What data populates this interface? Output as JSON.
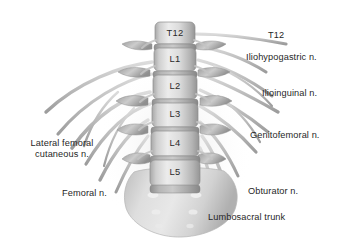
{
  "figure": {
    "background_color": "#ffffff",
    "width": 347,
    "height": 242,
    "style": "grayscale medical illustration"
  },
  "palette": {
    "background": "#ffffff",
    "bone_light": "#e3e3e3",
    "bone_mid": "#c9c9c9",
    "bone_dark": "#9a9a9a",
    "bone_shadow": "#7e7e7e",
    "nerve_light": "#d2d2d2",
    "nerve_mid": "#b4b4b4",
    "nerve_dark": "#8e8e8e",
    "text": "#1f1f1f"
  },
  "vertebrae": [
    {
      "label": "T12",
      "x": 173,
      "y": 33
    },
    {
      "label": "L1",
      "x": 173,
      "y": 59
    },
    {
      "label": "L2",
      "x": 173,
      "y": 85
    },
    {
      "label": "L3",
      "x": 173,
      "y": 113
    },
    {
      "label": "L4",
      "x": 173,
      "y": 141
    },
    {
      "label": "L5",
      "x": 173,
      "y": 170
    }
  ],
  "nerve_labels": [
    {
      "id": "t12",
      "text": "T12",
      "x": 268,
      "y": 35,
      "side": "right",
      "lines": 1
    },
    {
      "id": "iliohypogastric",
      "text": "Iliohypogastric n.",
      "x": 246,
      "y": 57,
      "side": "right",
      "lines": 1
    },
    {
      "id": "ilioinguinal",
      "text": "Ilioinguinal n.",
      "x": 262,
      "y": 93,
      "side": "right",
      "lines": 1
    },
    {
      "id": "genitofemoral",
      "text": "Genitofemoral n.",
      "x": 250,
      "y": 135,
      "side": "right",
      "lines": 1
    },
    {
      "id": "obturator",
      "text": "Obturator n.",
      "x": 248,
      "y": 191,
      "side": "right",
      "lines": 1
    },
    {
      "id": "lumbosacral-trunk",
      "text": "Lumbosacral trunk",
      "x": 208,
      "y": 217,
      "side": "right",
      "lines": 1
    },
    {
      "id": "lateral-femoral-cutaneous",
      "text": "Lateral femoral cutaneous n.",
      "x": 12,
      "y": 143,
      "side": "left",
      "lines": 2
    },
    {
      "id": "femoral",
      "text": "Femoral n.",
      "x": 62,
      "y": 193,
      "side": "left",
      "lines": 1
    }
  ]
}
